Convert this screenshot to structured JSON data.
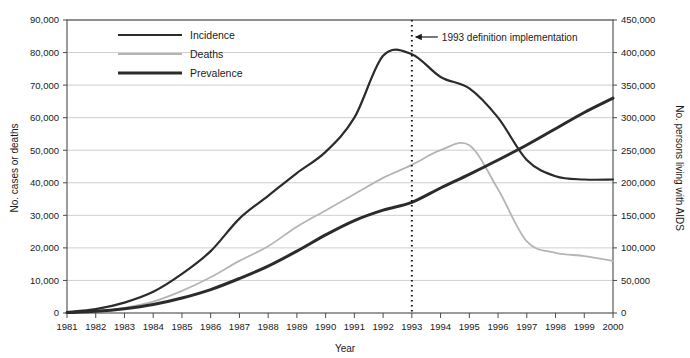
{
  "chart_data": {
    "type": "line",
    "title": "",
    "xlabel": "Year",
    "ylabel": "No. cases or deaths",
    "y2label": "No. persons living with AIDS",
    "grid": true,
    "legend_position": "top-left-inside",
    "xlim": [
      1981,
      2000
    ],
    "ylim": [
      0,
      90000
    ],
    "y2lim": [
      0,
      450000
    ],
    "x": [
      1981,
      1982,
      1983,
      1984,
      1985,
      1986,
      1987,
      1988,
      1989,
      1990,
      1991,
      1992,
      1993,
      1994,
      1995,
      1996,
      1997,
      1998,
      1999,
      2000
    ],
    "categories": [
      "1981",
      "1982",
      "1983",
      "1984",
      "1985",
      "1986",
      "1987",
      "1988",
      "1989",
      "1990",
      "1991",
      "1992",
      "1993",
      "1994",
      "1995",
      "1996",
      "1997",
      "1998",
      "1999",
      "2000"
    ],
    "xticklabels": [
      "1981",
      "1982",
      "1983",
      "1984",
      "1985",
      "1986",
      "1987",
      "1988",
      "1989",
      "1990",
      "1991",
      "1992",
      "1993",
      "1994",
      "1995",
      "1996",
      "1997",
      "1998",
      "1999",
      "2000"
    ],
    "yticklabels": [
      "0",
      "10,000",
      "20,000",
      "30,000",
      "40,000",
      "50,000",
      "60,000",
      "70,000",
      "80,000",
      "90,000"
    ],
    "ytickvalues": [
      0,
      10000,
      20000,
      30000,
      40000,
      50000,
      60000,
      70000,
      80000,
      90000
    ],
    "y2ticklabels": [
      "0",
      "50,000",
      "100,000",
      "150,000",
      "200,000",
      "250,000",
      "300,000",
      "350,000",
      "400,000",
      "450,000"
    ],
    "y2tickvalues": [
      0,
      50000,
      100000,
      150000,
      200000,
      250000,
      300000,
      350000,
      400000,
      450000
    ],
    "series": [
      {
        "name": "Incidence",
        "axis": "left",
        "color": "#2b2b2b",
        "width": 2.2,
        "values": [
          300,
          1200,
          3200,
          6500,
          12000,
          19000,
          29000,
          36000,
          43000,
          49500,
          60000,
          79000,
          79500,
          72500,
          69000,
          60000,
          47000,
          42000,
          41000,
          41000
        ]
      },
      {
        "name": "Deaths",
        "axis": "left",
        "color": "#b5b5b5",
        "width": 1.8,
        "values": [
          150,
          500,
          1600,
          3500,
          6800,
          11000,
          16000,
          20500,
          26500,
          31500,
          36500,
          41500,
          45500,
          50000,
          51500,
          38000,
          22000,
          18500,
          17500,
          16000
        ]
      },
      {
        "name": "Prevalence",
        "axis": "right",
        "color": "#2b2b2b",
        "width": 3.0,
        "values": [
          600,
          2500,
          6500,
          13000,
          23000,
          36000,
          53000,
          72000,
          95000,
          120000,
          142000,
          158000,
          170000,
          192000,
          213000,
          235000,
          258000,
          283000,
          308000,
          330000
        ]
      }
    ],
    "annotations": [
      {
        "name": "definition-change",
        "text": "1993 definition implementation",
        "x": 1993,
        "style": "dotted-vertical-line-with-arrow"
      }
    ]
  },
  "legend": {
    "items": [
      {
        "label": "Incidence"
      },
      {
        "label": "Deaths"
      },
      {
        "label": "Prevalence"
      }
    ]
  },
  "colors": {
    "incidence": "#2b2b2b",
    "deaths": "#b5b5b5",
    "prevalence": "#2b2b2b",
    "grid": "#c9c9c9",
    "axis": "#4a4a4a",
    "text": "#1a1a1a"
  }
}
